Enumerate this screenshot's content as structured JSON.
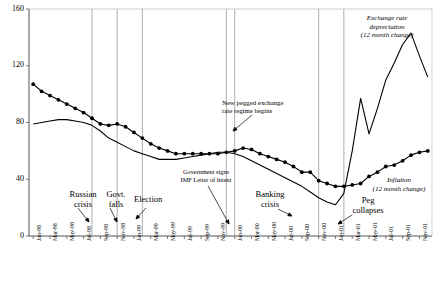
{
  "chart_data": {
    "type": "line",
    "title": "",
    "xlabel": "",
    "ylabel": "",
    "ylim": [
      0,
      160
    ],
    "yticks": [
      0,
      40,
      80,
      120,
      160
    ],
    "grid": "vertical-event-lines-only",
    "legend": "annotations-inline",
    "x": [
      "Jan-98",
      "Feb-98",
      "Mar-98",
      "Apr-98",
      "May-98",
      "Jun-98",
      "Jul-98",
      "Aug-98",
      "Sep-98",
      "Oct-98",
      "Nov-98",
      "Dec-98",
      "Jan-99",
      "Feb-99",
      "Mar-99",
      "Apr-99",
      "May-99",
      "Jun-99",
      "Jul-99",
      "Aug-99",
      "Sep-99",
      "Oct-99",
      "Nov-99",
      "Dec-99",
      "Jan-00",
      "Feb-00",
      "Mar-00",
      "Apr-00",
      "May-00",
      "Jun-00",
      "Jul-00",
      "Aug-00",
      "Sep-00",
      "Oct-00",
      "Nov-00",
      "Dec-00",
      "Jan-01",
      "Feb-01",
      "Mar-01",
      "Apr-01",
      "May-01",
      "Jun-01",
      "Jul-01",
      "Aug-01",
      "Sep-01",
      "Oct-01",
      "Nov-01",
      "Dec-01"
    ],
    "xticks": [
      "Jan-98",
      "Mar-98",
      "May-98",
      "Jul-98",
      "Sep-98",
      "Nov-98",
      "Jan-99",
      "Mar-99",
      "May-99",
      "Jul-99",
      "Sep-99",
      "Nov-99",
      "Jan-00",
      "Mar-00",
      "May-00",
      "Jul-00",
      "Sep-00",
      "Nov-00",
      "Jan-01",
      "Mar-01",
      "May-01",
      "Jul-01",
      "Sep-01",
      "Nov-01"
    ],
    "series": [
      {
        "name": "Inflation (12 month change)",
        "marker": "filled-circle",
        "color": "#000000",
        "values": [
          107,
          102,
          99,
          96,
          93,
          90,
          87,
          83,
          79,
          78,
          79,
          77,
          73,
          69,
          65,
          62,
          60,
          58,
          58,
          58,
          58,
          58,
          58,
          59,
          60,
          62,
          61,
          58,
          56,
          54,
          52,
          49,
          45,
          45,
          39,
          37,
          35,
          35,
          36,
          37,
          42,
          45,
          49,
          50,
          53,
          57,
          59,
          60
        ]
      },
      {
        "name": "Exchange rate depreciation (12 month change)",
        "marker": "none",
        "color": "#000000",
        "values": [
          79,
          80,
          81,
          82,
          82,
          81,
          80,
          78,
          74,
          69,
          66,
          63,
          60,
          58,
          56,
          54,
          54,
          54,
          55,
          56,
          57,
          58,
          59,
          59,
          58,
          56,
          53,
          50,
          47,
          44,
          41,
          38,
          35,
          31,
          27,
          24,
          22,
          30,
          60,
          97,
          72,
          90,
          110,
          122,
          135,
          143,
          127,
          112
        ]
      }
    ],
    "events": [
      {
        "label": "Russian crisis",
        "x": "Aug-98"
      },
      {
        "label": "Govt. falls",
        "x": "Nov-98"
      },
      {
        "label": "Election",
        "x": "Feb-99"
      },
      {
        "label": "Government signs IMF Letter of Intent",
        "x": "Dec-99"
      },
      {
        "label": "New pegged exchange rate regime begins",
        "x": "Jan-00"
      },
      {
        "label": "Banking crisis",
        "x": "Nov-00"
      },
      {
        "label": "Peg collapses",
        "x": "Feb-01"
      }
    ]
  },
  "annotations": {
    "russian_crisis_l1": "Russian",
    "russian_crisis_l2": "crisis",
    "govt_falls_l1": "Govt.",
    "govt_falls_l2": "falls",
    "election": "Election",
    "imf_l1": "Government signs",
    "imf_l2": "IMF Letter of Intent",
    "peg_begins_l1": "New pegged exchange",
    "peg_begins_l2": "rate regime begins",
    "banking_crisis_l1": "Banking",
    "banking_crisis_l2": "crisis",
    "peg_collapses_l1": "Peg",
    "peg_collapses_l2": "collapses",
    "exch_l1": "Exchange rate",
    "exch_l2": "depreciation",
    "exch_l3": "(12 month change)",
    "infl_l1": "Inflation",
    "infl_l2": "(12 month change)"
  }
}
